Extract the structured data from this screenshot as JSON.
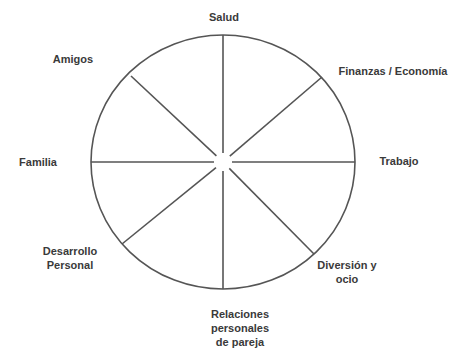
{
  "diagram": {
    "type": "wheel-of-life",
    "colors": {
      "stroke": "#555555",
      "text": "#3a3a3a",
      "background": "#ffffff"
    },
    "geometry": {
      "cx": 223,
      "cy": 162,
      "rx": 132,
      "ry": 127,
      "center_gap": 9
    },
    "segments": [
      {
        "id": "salud",
        "lines": [
          "Salud"
        ],
        "x": 224,
        "y": 17
      },
      {
        "id": "finanzas",
        "lines": [
          "Finanzas / Economía"
        ],
        "x": 393,
        "y": 71
      },
      {
        "id": "trabajo",
        "lines": [
          "Trabajo"
        ],
        "x": 399,
        "y": 161
      },
      {
        "id": "diversion",
        "lines": [
          "Diversión y",
          "ocio"
        ],
        "x": 347,
        "y": 272
      },
      {
        "id": "relaciones",
        "lines": [
          "Relaciones",
          "personales",
          "de pareja"
        ],
        "x": 240,
        "y": 328
      },
      {
        "id": "desarrollo",
        "lines": [
          "Desarrollo",
          "Personal"
        ],
        "x": 70,
        "y": 258
      },
      {
        "id": "familia",
        "lines": [
          "Familia"
        ],
        "x": 38,
        "y": 162
      },
      {
        "id": "amigos",
        "lines": [
          "Amigos"
        ],
        "x": 73,
        "y": 59
      }
    ],
    "spokes": [
      {
        "x2": 223,
        "y2": 35
      },
      {
        "x2": 322,
        "y2": 77
      },
      {
        "x2": 355,
        "y2": 162
      },
      {
        "x2": 314,
        "y2": 254
      },
      {
        "x2": 223,
        "y2": 289
      },
      {
        "x2": 122,
        "y2": 244
      },
      {
        "x2": 91,
        "y2": 162
      },
      {
        "x2": 131,
        "y2": 76
      }
    ]
  }
}
